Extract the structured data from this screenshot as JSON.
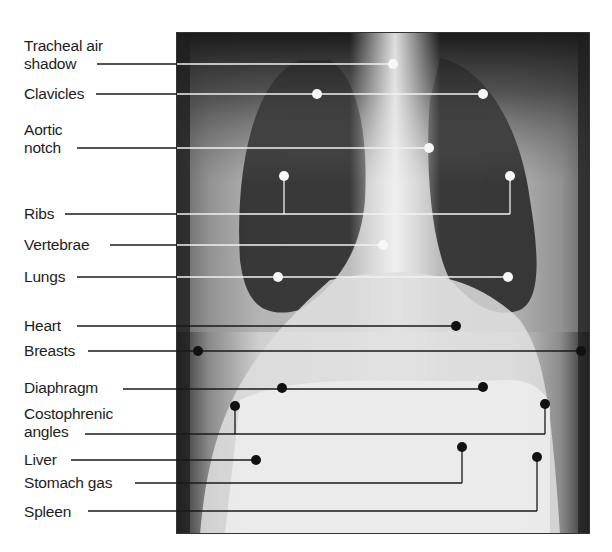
{
  "figure": {
    "frame": {
      "x": 176,
      "y": 32,
      "width": 414,
      "height": 502
    },
    "colors": {
      "background": "#ffffff",
      "text": "#1d1d1d",
      "leader_dark": "#1a1a1a",
      "leader_light": "#f2f2f2",
      "dot_dark": "#111111",
      "dot_light": "#f7f7f7"
    },
    "labels": [
      {
        "id": "tracheal-air-shadow",
        "lines": [
          "Tracheal air",
          "shadow"
        ],
        "top": 37,
        "line_y": 64,
        "line_start": 97,
        "tone": "light",
        "targets": [
          {
            "x": 393,
            "y": 64
          }
        ]
      },
      {
        "id": "clavicles",
        "lines": [
          "Clavicles"
        ],
        "top": 85,
        "line_y": 94,
        "line_start": 96,
        "tone": "light",
        "targets": [
          {
            "x": 317,
            "y": 94
          },
          {
            "x": 483,
            "y": 94
          }
        ]
      },
      {
        "id": "aortic-notch",
        "lines": [
          "Aortic",
          "notch"
        ],
        "top": 121,
        "line_y": 148,
        "line_start": 77,
        "tone": "light",
        "targets": [
          {
            "x": 429,
            "y": 148
          }
        ]
      },
      {
        "id": "ribs",
        "lines": [
          "Ribs"
        ],
        "top": 205,
        "line_y": 214,
        "line_start": 65,
        "tone": "light",
        "targets": [
          {
            "x": 284,
            "y": 176,
            "elbow": true
          },
          {
            "x": 510,
            "y": 176,
            "elbow": true
          }
        ]
      },
      {
        "id": "vertebrae",
        "lines": [
          "Vertebrae"
        ],
        "top": 236,
        "line_y": 245,
        "line_start": 110,
        "tone": "light",
        "targets": [
          {
            "x": 383,
            "y": 245
          }
        ]
      },
      {
        "id": "lungs",
        "lines": [
          "Lungs"
        ],
        "top": 268,
        "line_y": 277,
        "line_start": 77,
        "tone": "light",
        "targets": [
          {
            "x": 278,
            "y": 277
          },
          {
            "x": 508,
            "y": 277
          }
        ]
      },
      {
        "id": "heart",
        "lines": [
          "Heart"
        ],
        "top": 317,
        "line_y": 326,
        "line_start": 77,
        "tone": "dark",
        "targets": [
          {
            "x": 456,
            "y": 326
          }
        ]
      },
      {
        "id": "breasts",
        "lines": [
          "Breasts"
        ],
        "top": 342,
        "line_y": 351,
        "line_start": 88,
        "tone": "dark",
        "targets": [
          {
            "x": 198,
            "y": 351
          },
          {
            "x": 581,
            "y": 351
          }
        ]
      },
      {
        "id": "diaphragm",
        "lines": [
          "Diaphragm"
        ],
        "top": 379,
        "line_y": 389,
        "line_start": 123,
        "tone": "dark",
        "targets": [
          {
            "x": 282,
            "y": 388
          },
          {
            "x": 483,
            "y": 387
          }
        ]
      },
      {
        "id": "costophrenic-angles",
        "lines": [
          "Costophrenic",
          "angles"
        ],
        "top": 405,
        "line_y": 434,
        "line_start": 85,
        "tone": "dark",
        "targets": [
          {
            "x": 235,
            "y": 406,
            "elbow": true
          },
          {
            "x": 545,
            "y": 404,
            "elbow": true
          }
        ]
      },
      {
        "id": "liver",
        "lines": [
          "Liver"
        ],
        "top": 451,
        "line_y": 460,
        "line_start": 71,
        "tone": "dark",
        "targets": [
          {
            "x": 256,
            "y": 460
          }
        ]
      },
      {
        "id": "stomach-gas",
        "lines": [
          "Stomach gas"
        ],
        "top": 474,
        "line_y": 483,
        "line_start": 135,
        "tone": "dark",
        "targets": [
          {
            "x": 462,
            "y": 447,
            "elbow": true
          }
        ]
      },
      {
        "id": "spleen",
        "lines": [
          "Spleen"
        ],
        "top": 503,
        "line_y": 511,
        "line_start": 88,
        "tone": "dark",
        "targets": [
          {
            "x": 537,
            "y": 457,
            "elbow": true
          }
        ]
      }
    ]
  }
}
